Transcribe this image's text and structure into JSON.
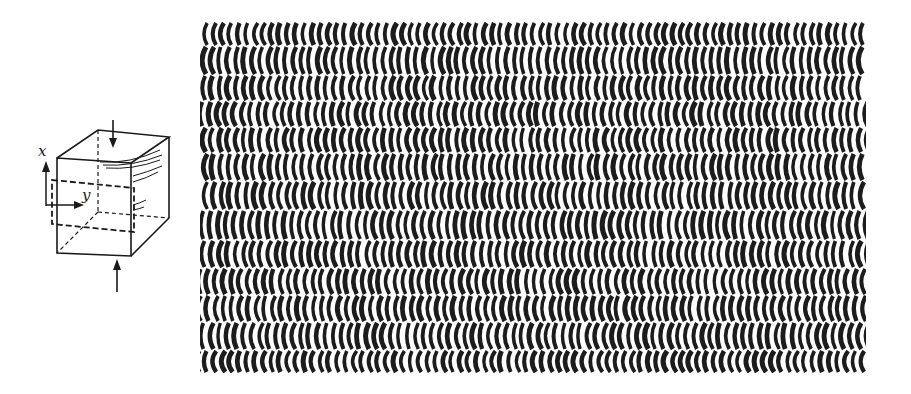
{
  "figure": {
    "type": "interference-fringe-figure",
    "cube_diagram": {
      "axis_labels": {
        "x": "x",
        "y": "y"
      },
      "load_arrows": [
        "top-compression-arrow",
        "bottom-compression-arrow"
      ],
      "section_plane": "dashed-rectangle"
    },
    "fringe_pattern": {
      "left": 200,
      "top": 22,
      "right": 866,
      "bottom": 373,
      "band_boundaries": [
        22,
        46,
        75,
        101,
        127,
        153,
        181,
        210,
        240,
        268,
        295,
        322,
        350,
        373
      ],
      "stripe_period": 8.2,
      "stripe_width": 4.2,
      "bow": 3.2,
      "colors": {
        "ink": "#1c1c1c",
        "paper": "#ffffff"
      }
    }
  }
}
